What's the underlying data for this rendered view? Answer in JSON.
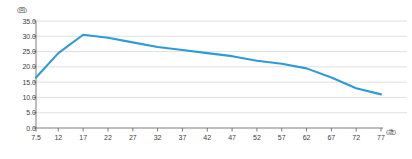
{
  "chart_data": {
    "type": "line",
    "title": "",
    "xlabel": "(歳)",
    "ylabel": "(回)",
    "x": [
      7.5,
      12,
      17,
      22,
      27,
      32,
      37,
      42,
      47,
      52,
      57,
      62,
      67,
      72,
      77
    ],
    "values": [
      16.5,
      24.5,
      30.5,
      29.5,
      28.0,
      26.5,
      25.5,
      24.5,
      23.5,
      22.0,
      21.0,
      19.5,
      16.5,
      13.0,
      11.0
    ],
    "series": [
      {
        "name": "",
        "color": "#2e9bd6",
        "values": [
          16.5,
          24.5,
          30.5,
          29.5,
          28.0,
          26.5,
          25.5,
          24.5,
          23.5,
          22.0,
          21.0,
          19.5,
          16.5,
          13.0,
          11.0
        ]
      }
    ],
    "xtick_labels": [
      "7.5",
      "12",
      "17",
      "22",
      "27",
      "32",
      "37",
      "42",
      "47",
      "52",
      "57",
      "62",
      "67",
      "72",
      "77"
    ],
    "ytick_labels": [
      "0.0",
      "5.0",
      "10.0",
      "15.0",
      "20.0",
      "25.0",
      "30.0",
      "35.0"
    ],
    "ytick_values": [
      0.0,
      5.0,
      10.0,
      15.0,
      20.0,
      25.0,
      30.0,
      35.0
    ],
    "ylim": [
      0.0,
      35.0
    ],
    "xlim": [
      7.5,
      77
    ],
    "grid": "horizontal",
    "legend": "none",
    "line_color": "#2e9bd6",
    "grid_color": "#d8d8d8",
    "axis_color": "#6e6e6e"
  },
  "axis": {
    "y_unit": "(回)",
    "x_unit": "(歳)"
  },
  "caption": ""
}
